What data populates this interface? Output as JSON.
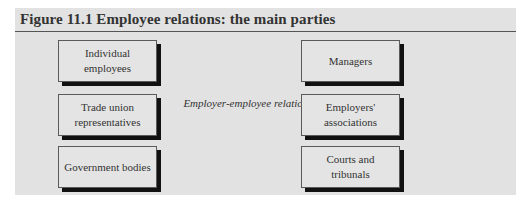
{
  "figure": {
    "title": "Figure 11.1 Employee relations: the main parties",
    "center_label": "Employer-employee relations",
    "left_column": [
      {
        "label": "Individual employees"
      },
      {
        "label": "Trade union representatives"
      },
      {
        "label": "Government bodies"
      }
    ],
    "right_column": [
      {
        "label": "Managers"
      },
      {
        "label": "Employers' associations"
      },
      {
        "label": "Courts and tribunals"
      }
    ]
  },
  "colors": {
    "panel_background": "#e2e2e2",
    "box_border": "#5a5a5a",
    "box_shadow": "#111111",
    "title_rule": "#555555"
  }
}
